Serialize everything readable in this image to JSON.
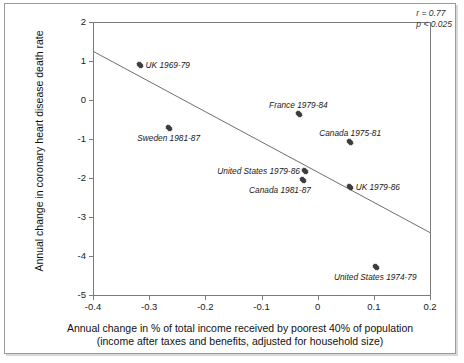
{
  "chart_data": {
    "type": "scatter",
    "title": "",
    "xlabel": "Annual change in % of total income received by poorest 40% of population (income after taxes and benefits, adjusted for household size)",
    "xlabel_line1": "Annual change in % of total income received by poorest 40% of population",
    "xlabel_line2": "(income after taxes and benefits, adjusted for household size)",
    "ylabel": "Annual change in coronary heart disease death rate",
    "xlim": [
      -0.4,
      0.2
    ],
    "ylim": [
      -5,
      2
    ],
    "xticks": [
      "-0.4",
      "-0.3",
      "-0.2",
      "-0.1",
      "0",
      "0.1",
      "0.2"
    ],
    "xtick_values": [
      -0.4,
      -0.3,
      -0.2,
      -0.1,
      0,
      0.1,
      0.2
    ],
    "yticks": [
      "2",
      "1",
      "0",
      "-1",
      "-2",
      "-3",
      "-4",
      "-5"
    ],
    "ytick_values": [
      2,
      1,
      0,
      -1,
      -2,
      -3,
      -4,
      -5
    ],
    "grid": false,
    "legend": "none",
    "points": [
      {
        "label": "UK 1969-79",
        "x": -0.317,
        "y": 0.9,
        "label_pos": "right"
      },
      {
        "label": "Sweden 1981-87",
        "x": -0.265,
        "y": -0.72,
        "label_pos": "below"
      },
      {
        "label": "France 1979-84",
        "x": -0.034,
        "y": -0.35,
        "label_pos": "above"
      },
      {
        "label": "Canada 1975-81",
        "x": 0.058,
        "y": -1.08,
        "label_pos": "above"
      },
      {
        "label": "United States 1979-86",
        "x": -0.022,
        "y": -1.82,
        "label_pos": "left"
      },
      {
        "label": "Canada 1981-87",
        "x": -0.026,
        "y": -2.04,
        "label_pos": "below-left"
      },
      {
        "label": "UK 1979-86",
        "x": 0.057,
        "y": -2.24,
        "label_pos": "right"
      },
      {
        "label": "United States 1974-79",
        "x": 0.103,
        "y": -4.28,
        "label_pos": "below"
      }
    ],
    "trendline": {
      "x1": -0.4,
      "y1": 1.25,
      "x2": 0.2,
      "y2": -3.4
    },
    "annotations": {
      "r_text": "r = 0.77",
      "p_text": "p < 0.025",
      "r_value": 0.77,
      "p_value": "< 0.025"
    },
    "colors": {
      "marker": "#3d3d3d",
      "line": "#6e6e6e",
      "axis": "#7b7b7b",
      "text": "#1a1a1a",
      "frame": "#9a9a9a",
      "background": "#ffffff"
    }
  }
}
